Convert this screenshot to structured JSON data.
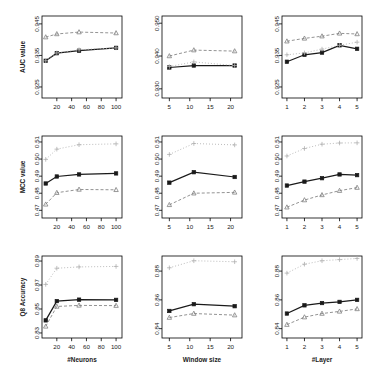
{
  "figure": {
    "rows": [
      "AUC value",
      "MCC value",
      "Q8 Accuracy"
    ],
    "columns": [
      "#Neurons",
      "Window size",
      "#Layer"
    ]
  },
  "series_style": {
    "solid_square": {
      "color": "#1a1a1a",
      "marker": "square",
      "dash": "none"
    },
    "dashed_triangle": {
      "color": "#808080",
      "marker": "triangle",
      "dash": "3,2"
    },
    "dotted_plus": {
      "color": "#b0b0b0",
      "marker": "plus",
      "dash": "1,2"
    }
  },
  "chart_data": [
    {
      "type": "line",
      "panel": "r1c1",
      "title": "",
      "xlabel": "",
      "ylabel": "AUC value",
      "x": [
        5,
        20,
        50,
        100
      ],
      "xticks": [
        20,
        40,
        60,
        80,
        100
      ],
      "xlim": [
        0,
        108
      ],
      "yticks": [
        0.925,
        0.935,
        0.945
      ],
      "ytick_labels": [
        "0.925",
        "0.935",
        "0.945"
      ],
      "ylim": [
        0.9215,
        0.9475
      ],
      "grid": false,
      "series": [
        {
          "name": "solid_square",
          "values": [
            0.9333,
            0.9357,
            0.9365,
            0.9374
          ]
        },
        {
          "name": "dashed_triangle",
          "values": [
            0.9408,
            0.9418,
            0.9424,
            0.9421
          ]
        },
        {
          "name": "dotted_plus",
          "values": [
            0.9333,
            0.9358,
            0.9368,
            0.9374
          ]
        }
      ]
    },
    {
      "type": "line",
      "panel": "r1c2",
      "title": "",
      "xlabel": "",
      "ylabel": "AUC value",
      "x": [
        5,
        11,
        21
      ],
      "xticks": [
        5,
        10,
        15,
        20
      ],
      "xlim": [
        3.2,
        22.8
      ],
      "yticks": [
        0.93,
        0.94,
        0.95
      ],
      "ytick_labels": [
        "0.930",
        "0.940",
        "0.950"
      ],
      "ylim": [
        0.9272,
        0.9522
      ],
      "grid": false,
      "series": [
        {
          "name": "solid_square",
          "values": [
            0.9365,
            0.9371,
            0.9371
          ]
        },
        {
          "name": "dashed_triangle",
          "values": [
            0.94,
            0.9418,
            0.9415
          ]
        },
        {
          "name": "dotted_plus",
          "values": [
            0.9368,
            0.9382,
            0.9371
          ]
        }
      ]
    },
    {
      "type": "line",
      "panel": "r1c3",
      "title": "",
      "xlabel": "",
      "ylabel": "AUC value",
      "x": [
        1,
        2,
        3,
        4,
        5
      ],
      "xticks": [
        1,
        2,
        3,
        4,
        5
      ],
      "xlim": [
        0.72,
        5.28
      ],
      "yticks": [
        0.925,
        0.935,
        0.945
      ],
      "ytick_labels": [
        "0.925",
        "0.935",
        "0.945"
      ],
      "ylim": [
        0.9215,
        0.9475
      ],
      "grid": false,
      "series": [
        {
          "name": "solid_square",
          "values": [
            0.933,
            0.9352,
            0.9359,
            0.9382,
            0.9371
          ]
        },
        {
          "name": "dashed_triangle",
          "values": [
            0.9395,
            0.9404,
            0.9411,
            0.942,
            0.9418
          ]
        },
        {
          "name": "dotted_plus",
          "values": [
            0.9352,
            0.9358,
            0.937,
            0.9382,
            0.9392
          ]
        }
      ]
    },
    {
      "type": "line",
      "panel": "r2c1",
      "title": "",
      "xlabel": "",
      "ylabel": "MCC value",
      "x": [
        5,
        20,
        50,
        100
      ],
      "xticks": [
        20,
        40,
        60,
        80,
        100
      ],
      "xlim": [
        0,
        108
      ],
      "yticks": [
        0.47,
        0.48,
        0.49,
        0.5,
        0.51
      ],
      "ytick_labels": [
        "0.47",
        "0.48",
        "0.49",
        "0.50",
        "0.51"
      ],
      "ylim": [
        0.4655,
        0.5135
      ],
      "grid": false,
      "series": [
        {
          "name": "solid_square",
          "values": [
            0.4857,
            0.4898,
            0.491,
            0.4916
          ]
        },
        {
          "name": "dashed_triangle",
          "values": [
            0.4735,
            0.4803,
            0.4822,
            0.482
          ]
        },
        {
          "name": "dotted_plus",
          "values": [
            0.4998,
            0.5058,
            0.5084,
            0.5089
          ]
        }
      ]
    },
    {
      "type": "line",
      "panel": "r2c2",
      "title": "",
      "xlabel": "",
      "ylabel": "MCC value",
      "x": [
        5,
        11,
        21
      ],
      "xticks": [
        5,
        10,
        15,
        20
      ],
      "xlim": [
        3.2,
        22.8
      ],
      "yticks": [
        0.47,
        0.48,
        0.49,
        0.5,
        0.51
      ],
      "ytick_labels": [
        "0.47",
        "0.48",
        "0.49",
        "0.50",
        "0.51"
      ],
      "ylim": [
        0.4655,
        0.5135
      ],
      "grid": false,
      "series": [
        {
          "name": "solid_square",
          "values": [
            0.4862,
            0.4923,
            0.4895
          ]
        },
        {
          "name": "dashed_triangle",
          "values": [
            0.4732,
            0.48,
            0.4805
          ]
        },
        {
          "name": "dotted_plus",
          "values": [
            0.5027,
            0.5091,
            0.5083
          ]
        }
      ]
    },
    {
      "type": "line",
      "panel": "r2c3",
      "title": "",
      "xlabel": "",
      "ylabel": "MCC value",
      "x": [
        1,
        2,
        3,
        4,
        5
      ],
      "xticks": [
        1,
        2,
        3,
        4,
        5
      ],
      "xlim": [
        0.72,
        5.28
      ],
      "yticks": [
        0.47,
        0.48,
        0.49,
        0.5,
        0.51
      ],
      "ytick_labels": [
        "0.47",
        "0.48",
        "0.49",
        "0.50",
        "0.51"
      ],
      "ylim": [
        0.4655,
        0.5135
      ],
      "grid": false,
      "series": [
        {
          "name": "solid_square",
          "values": [
            0.4845,
            0.4868,
            0.4888,
            0.491,
            0.4906
          ]
        },
        {
          "name": "dashed_triangle",
          "values": [
            0.4718,
            0.476,
            0.479,
            0.4815,
            0.4833
          ]
        },
        {
          "name": "dotted_plus",
          "values": [
            0.5018,
            0.5062,
            0.5087,
            0.5094,
            0.5095
          ]
        }
      ]
    },
    {
      "type": "line",
      "panel": "r3c1",
      "title": "",
      "xlabel": "#Neurons",
      "ylabel": "Q8 Accuracy",
      "x": [
        5,
        20,
        50,
        100
      ],
      "xticks": [
        20,
        40,
        60,
        80,
        100
      ],
      "xlim": [
        0,
        108
      ],
      "yticks": [
        0.83,
        0.85,
        0.87,
        0.89
      ],
      "ytick_labels": [
        "0.83",
        "0.85",
        "0.87",
        "0.89"
      ],
      "ylim": [
        0.8258,
        0.8942
      ],
      "grid": false,
      "series": [
        {
          "name": "solid_square",
          "values": [
            0.8405,
            0.8566,
            0.8578,
            0.8576
          ]
        },
        {
          "name": "dashed_triangle",
          "values": [
            0.8355,
            0.8521,
            0.853,
            0.8528
          ]
        },
        {
          "name": "dotted_plus",
          "values": [
            0.8705,
            0.884,
            0.8851,
            0.8855
          ]
        }
      ]
    },
    {
      "type": "line",
      "panel": "r3c2",
      "title": "",
      "xlabel": "Window size",
      "ylabel": "Q8 Accuracy",
      "x": [
        5,
        11,
        21
      ],
      "xticks": [
        5,
        10,
        15,
        20
      ],
      "xlim": [
        3.2,
        22.8
      ],
      "yticks": [
        0.84,
        0.86,
        0.88
      ],
      "ytick_labels": [
        "0.84",
        "0.86",
        "0.88"
      ],
      "ylim": [
        0.8335,
        0.8905
      ],
      "grid": false,
      "series": [
        {
          "name": "solid_square",
          "values": [
            0.8523,
            0.857,
            0.8556
          ]
        },
        {
          "name": "dashed_triangle",
          "values": [
            0.8477,
            0.8505,
            0.8494
          ]
        },
        {
          "name": "dotted_plus",
          "values": [
            0.8823,
            0.8872,
            0.8865
          ]
        }
      ]
    },
    {
      "type": "line",
      "panel": "r3c3",
      "title": "",
      "xlabel": "#Layer",
      "ylabel": "Q8 Accuracy",
      "x": [
        1,
        2,
        3,
        4,
        5
      ],
      "xticks": [
        1,
        2,
        3,
        4,
        5
      ],
      "xlim": [
        0.72,
        5.28
      ],
      "yticks": [
        0.84,
        0.86,
        0.88
      ],
      "ytick_labels": [
        "0.84",
        "0.86",
        "0.88"
      ],
      "ylim": [
        0.8335,
        0.8905
      ],
      "grid": false,
      "series": [
        {
          "name": "solid_square",
          "values": [
            0.8505,
            0.8562,
            0.8578,
            0.8586,
            0.86
          ]
        },
        {
          "name": "dashed_triangle",
          "values": [
            0.8428,
            0.848,
            0.8505,
            0.852,
            0.8537
          ]
        },
        {
          "name": "dotted_plus",
          "values": [
            0.8786,
            0.8848,
            0.8872,
            0.888,
            0.8888
          ]
        }
      ]
    }
  ]
}
